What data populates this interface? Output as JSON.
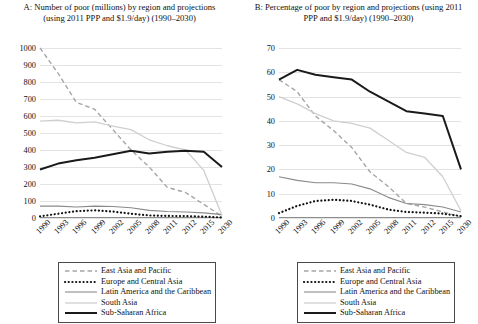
{
  "figure": {
    "panels": [
      {
        "id": "A",
        "title": "A: Number of poor (millions) by region and projections (using 2011 PPP and $1.9/day) (1990–2030)"
      },
      {
        "id": "B",
        "title": "B: Percentage of poor by region and projections (using 2011 PPP and $1.9/day) (1990–2030)"
      }
    ]
  },
  "legend": {
    "position": "below-plot",
    "entries": [
      {
        "label": "East Asia and Pacific",
        "style": "dashed",
        "color": "#a6a6a6",
        "width": 1.4
      },
      {
        "label": "Europe and Central Asia",
        "style": "dotted",
        "color": "#111111",
        "width": 2.2
      },
      {
        "label": "Latin America and the Caribbean",
        "style": "solid",
        "color": "#8a8a8a",
        "width": 1.1
      },
      {
        "label": "South Asia",
        "style": "solid",
        "color": "#cfcfcf",
        "width": 1.3
      },
      {
        "label": "Sub-Saharan Africa",
        "style": "solid",
        "color": "#1a1a1a",
        "width": 2.0
      }
    ]
  },
  "chart_data": [
    {
      "type": "line",
      "panel": "A",
      "title": "A: Number of poor (millions) by region and projections (using 2011 PPP and $1.9/day) (1990–2030)",
      "xlabel": "",
      "ylabel": "",
      "grid": true,
      "legend_position": "below",
      "categories": [
        "1990",
        "1993",
        "1996",
        "1999",
        "2002",
        "2005",
        "2008",
        "2011",
        "2012",
        "2015",
        "2030"
      ],
      "ylim": [
        0,
        1000
      ],
      "yticks": [
        0,
        100,
        200,
        300,
        400,
        500,
        600,
        700,
        800,
        900,
        1000
      ],
      "series": [
        {
          "name": "East Asia and Pacific",
          "values": [
            1000,
            850,
            680,
            640,
            520,
            400,
            300,
            180,
            150,
            80,
            10
          ]
        },
        {
          "name": "Europe and Central Asia",
          "values": [
            10,
            25,
            40,
            45,
            38,
            25,
            15,
            12,
            11,
            8,
            3
          ]
        },
        {
          "name": "Latin America and the Caribbean",
          "values": [
            70,
            70,
            65,
            70,
            68,
            60,
            45,
            38,
            35,
            30,
            20
          ]
        },
        {
          "name": "South Asia",
          "values": [
            570,
            575,
            560,
            565,
            540,
            520,
            460,
            425,
            400,
            280,
            15
          ]
        },
        {
          "name": "Sub-Saharan Africa",
          "values": [
            285,
            320,
            340,
            355,
            375,
            395,
            380,
            390,
            395,
            390,
            300
          ]
        }
      ]
    },
    {
      "type": "line",
      "panel": "B",
      "title": "B: Percentage of poor by region and projections (using 2011 PPP and $1.9/day) (1990–2030)",
      "xlabel": "",
      "ylabel": "",
      "grid": true,
      "legend_position": "below",
      "categories": [
        "1990",
        "1993",
        "1996",
        "1999",
        "2002",
        "2005",
        "2008",
        "2011",
        "2012",
        "2015",
        "2030"
      ],
      "ylim": [
        0,
        70
      ],
      "yticks": [
        0,
        10,
        20,
        30,
        40,
        50,
        60,
        70
      ],
      "series": [
        {
          "name": "East Asia and Pacific",
          "values": [
            57,
            52,
            42,
            36,
            29,
            19,
            13,
            6,
            4.5,
            2.5,
            0.5
          ]
        },
        {
          "name": "Europe and Central Asia",
          "values": [
            2,
            5,
            7,
            7.5,
            7,
            5.5,
            3.5,
            2.5,
            2.2,
            1.8,
            0.8
          ]
        },
        {
          "name": "Latin America and the Caribbean",
          "values": [
            17,
            15.5,
            14.5,
            14.5,
            14,
            12,
            8.5,
            6,
            5.5,
            4.5,
            2.5
          ]
        },
        {
          "name": "South Asia",
          "values": [
            50,
            47,
            43,
            40,
            39,
            37,
            32,
            27,
            25,
            17,
            3
          ]
        },
        {
          "name": "Sub-Saharan Africa",
          "values": [
            57,
            61,
            59,
            58,
            57,
            52,
            48,
            44,
            43,
            42,
            20
          ]
        }
      ]
    }
  ]
}
